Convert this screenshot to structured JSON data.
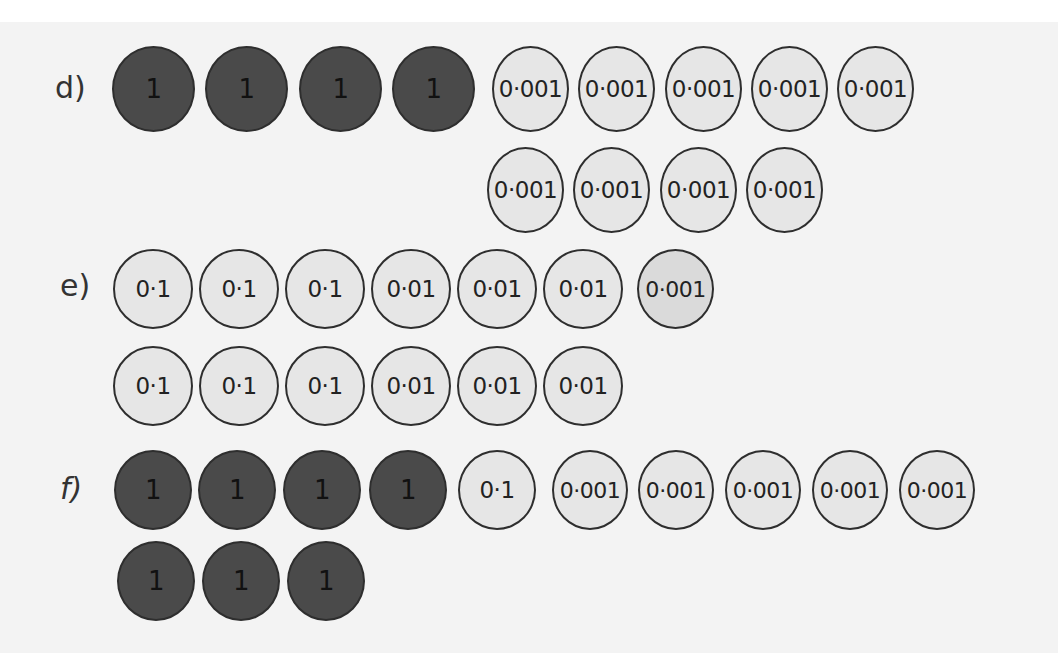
{
  "questions": [
    {
      "label": "d)",
      "rows": [
        [
          "1",
          "1",
          "1",
          "1",
          "0·001",
          "0·001",
          "0·001",
          "0·001",
          "0·001"
        ],
        [
          "0·001",
          "0·001",
          "0·001",
          "0·001"
        ]
      ]
    },
    {
      "label": "e)",
      "rows": [
        [
          "0·1",
          "0·1",
          "0·1",
          "0·01",
          "0·01",
          "0·01",
          "0·001"
        ],
        [
          "0·1",
          "0·1",
          "0·1",
          "0·01",
          "0·01",
          "0·01"
        ]
      ]
    },
    {
      "label": "f)",
      "rows": [
        [
          "1",
          "1",
          "1",
          "1",
          "0·1",
          "0·001",
          "0·001",
          "0·001",
          "0·001",
          "0·001"
        ],
        [
          "1",
          "1",
          "1"
        ]
      ]
    }
  ],
  "colors": {
    "ones_counter": "#4a4a4a",
    "decimal_counter": "#e6e6e6",
    "outline": "#2e2e2e",
    "background": "#f3f3f3"
  }
}
